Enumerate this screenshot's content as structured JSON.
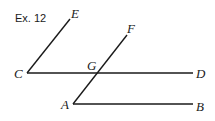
{
  "title": "Ex. 12",
  "points": {
    "C": {
      "label": "C",
      "x": 27,
      "y": 73
    },
    "D": {
      "label": "D",
      "x": 193,
      "y": 73
    },
    "E": {
      "label": "E",
      "x": 70,
      "y": 19
    },
    "F": {
      "label": "F",
      "x": 127,
      "y": 35
    },
    "G": {
      "label": "G",
      "x": 96,
      "y": 73
    },
    "A": {
      "label": "A",
      "x": 73,
      "y": 104
    },
    "B": {
      "label": "B",
      "x": 193,
      "y": 104
    }
  },
  "segments": [
    {
      "name": "segment-CE",
      "from": "C",
      "to": "E"
    },
    {
      "name": "segment-CD",
      "from": "C",
      "to": "D"
    },
    {
      "name": "segment-AF",
      "from": "A",
      "to": "F"
    },
    {
      "name": "segment-AB",
      "from": "A",
      "to": "B"
    }
  ]
}
